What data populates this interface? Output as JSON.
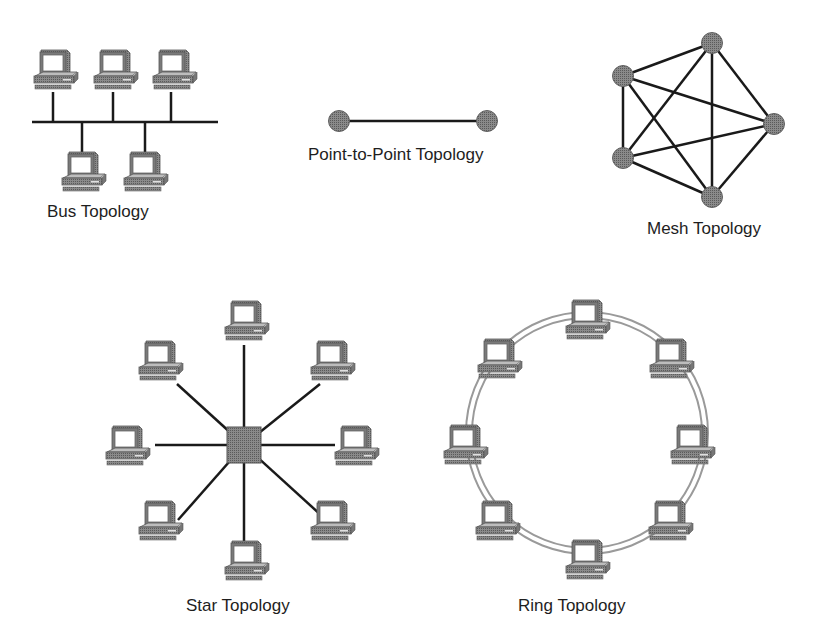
{
  "diagram": {
    "colors": {
      "background": "#ffffff",
      "line": "#1a1a1a",
      "node": "#6a6a6a",
      "node_stroke": "#505050",
      "ring": "#9a9a9a",
      "label": "#1e1e1e"
    },
    "bus": {
      "label": "Bus Topology",
      "computers": 5,
      "top_computers": 3,
      "bottom_computers": 2
    },
    "point_to_point": {
      "label": "Point-to-Point Topology",
      "nodes": 2
    },
    "mesh": {
      "label": "Mesh Topology",
      "nodes": 5,
      "connections": "fully-connected"
    },
    "star": {
      "label": "Star Topology",
      "hub": "central-hub",
      "computers": 8
    },
    "ring": {
      "label": "Ring Topology",
      "computers": 8
    }
  }
}
